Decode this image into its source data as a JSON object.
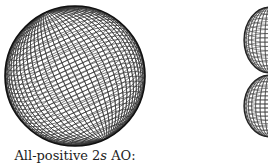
{
  "figure": {
    "panels": [
      {
        "name": "2s-orbital-sphere",
        "shape": "sphere",
        "style": "wireframe mesh"
      },
      {
        "name": "p-orbital-lobes",
        "shape": "two lobes (partially cropped)",
        "style": "wireframe mesh"
      }
    ],
    "caption": {
      "prefix": "All-positive 2",
      "orbital": "s",
      "suffix": " AO:"
    }
  }
}
